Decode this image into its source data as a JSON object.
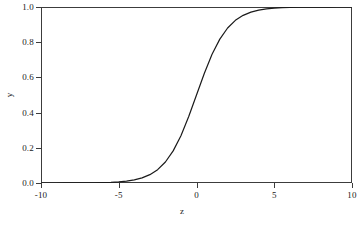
{
  "chart_data": {
    "type": "line",
    "title": "",
    "subtitle": "",
    "xlabel": "z",
    "ylabel": "y",
    "xlim": [
      -10,
      10
    ],
    "ylim": [
      0.0,
      1.0
    ],
    "xticks": [
      -10,
      -5,
      0,
      5,
      10
    ],
    "xticklabels": [
      "-10",
      "-5",
      "0",
      "5",
      "10"
    ],
    "yticks": [
      0.0,
      0.2,
      0.4,
      0.6,
      0.8,
      1.0
    ],
    "yticklabels": [
      "0.0",
      "0.2",
      "0.4",
      "0.6",
      "0.8",
      "1.0"
    ],
    "grid": false,
    "legend": null,
    "annotations": [],
    "line_color": "#1a1a1a",
    "line_width": 1.2,
    "frame_color": "#3c3c3c",
    "background_color": "#ffffff",
    "series": [
      {
        "name": "sigmoid",
        "formula": "y = 1 / (1 + exp(-z))",
        "x": [
          -10,
          -9.5,
          -9,
          -8.5,
          -8,
          -7.5,
          -7,
          -6.5,
          -6,
          -5.5,
          -5,
          -4.5,
          -4,
          -3.5,
          -3,
          -2.5,
          -2,
          -1.5,
          -1,
          -0.5,
          0,
          0.5,
          1,
          1.5,
          2,
          2.5,
          3,
          3.5,
          4,
          4.5,
          5,
          5.5,
          6,
          6.5,
          7,
          7.5,
          8,
          8.5,
          9,
          9.5,
          10
        ],
        "values": [
          4.54e-05,
          7.49e-05,
          0.0001234,
          0.0002034,
          0.0003354,
          0.0005527,
          0.0009111,
          0.0015,
          0.0024726,
          0.0040702,
          0.0066929,
          0.0109869,
          0.0179862,
          0.0293122,
          0.0474259,
          0.0758582,
          0.1192029,
          0.1824255,
          0.2689414,
          0.3775407,
          0.5,
          0.6224593,
          0.7310586,
          0.8175745,
          0.8807971,
          0.9241418,
          0.9525741,
          0.9706877,
          0.9820138,
          0.9890131,
          0.9933071,
          0.9959298,
          0.9975274,
          0.9984987,
          0.9990889,
          0.9994473,
          0.9996646,
          0.9997966,
          0.9998766,
          0.9999251,
          0.9999546
        ]
      }
    ]
  }
}
